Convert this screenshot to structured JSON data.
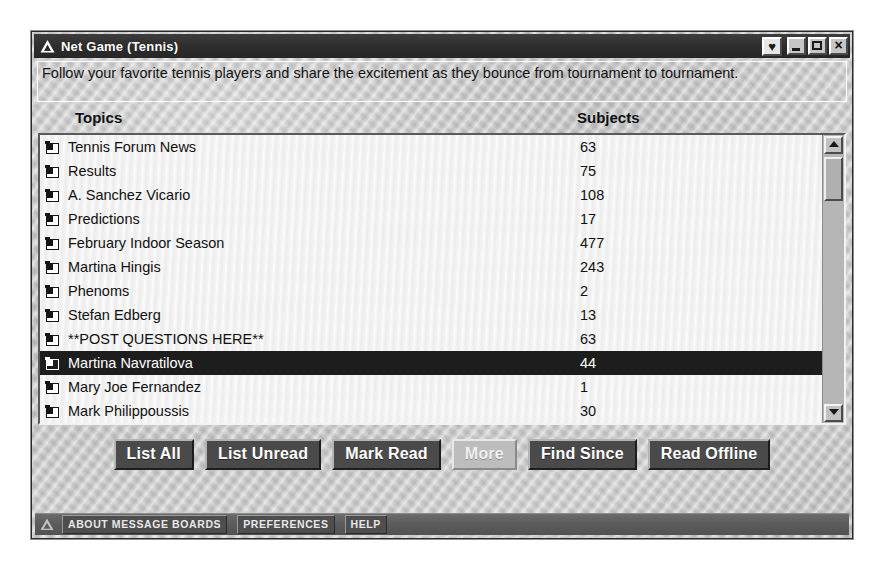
{
  "window": {
    "title": "Net Game (Tennis)",
    "title_icon": "aol-triangle-icon",
    "controls": {
      "heart_label": "♥",
      "heart_icon": "heart-icon",
      "minimize_icon": "minimize-icon",
      "maximize_icon": "maximize-icon",
      "close_label": "×",
      "close_icon": "close-icon"
    }
  },
  "description": {
    "text": "Follow your favorite tennis players and share the excitement as they bounce from tournament to tournament."
  },
  "columns": {
    "topics": "Topics",
    "subjects": "Subjects"
  },
  "list": {
    "rows": [
      {
        "topic": "Tennis Forum News",
        "subjects": "63",
        "selected": false
      },
      {
        "topic": "Results",
        "subjects": "75",
        "selected": false
      },
      {
        "topic": "A. Sanchez Vicario",
        "subjects": "108",
        "selected": false
      },
      {
        "topic": "Predictions",
        "subjects": "17",
        "selected": false
      },
      {
        "topic": "February Indoor Season",
        "subjects": "477",
        "selected": false
      },
      {
        "topic": "Martina Hingis",
        "subjects": "243",
        "selected": false
      },
      {
        "topic": "Phenoms",
        "subjects": "2",
        "selected": false
      },
      {
        "topic": "Stefan Edberg",
        "subjects": "13",
        "selected": false
      },
      {
        "topic": "**POST QUESTIONS HERE**",
        "subjects": "63",
        "selected": false
      },
      {
        "topic": "Martina Navratilova",
        "subjects": "44",
        "selected": true
      },
      {
        "topic": "Mary Joe Fernandez",
        "subjects": "1",
        "selected": false
      },
      {
        "topic": "Mark Philippoussis",
        "subjects": "30",
        "selected": false
      }
    ]
  },
  "scrollbar": {
    "up_icon": "scroll-up-arrow-icon",
    "down_icon": "scroll-down-arrow-icon"
  },
  "buttons": [
    {
      "label": "List All",
      "disabled": false
    },
    {
      "label": "List Unread",
      "disabled": false
    },
    {
      "label": "Mark Read",
      "disabled": false
    },
    {
      "label": "More",
      "disabled": true
    },
    {
      "label": "Find Since",
      "disabled": false
    },
    {
      "label": "Read Offline",
      "disabled": false
    }
  ],
  "statusbar": {
    "icon": "aol-triangle-icon",
    "buttons": [
      {
        "label": "ABOUT MESSAGE BOARDS"
      },
      {
        "label": "PREFERENCES"
      },
      {
        "label": "HELP"
      }
    ]
  },
  "colors": {
    "titlebar": "#2e2e2e",
    "selection": "#1d1d1d",
    "button_face": "#4a4a4a",
    "window_face": "#c3c3c3",
    "statusbar": "#5c5c5c"
  }
}
